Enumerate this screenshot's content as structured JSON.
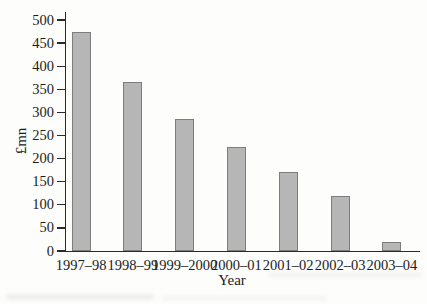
{
  "chart_data": {
    "type": "bar",
    "title": "",
    "categories": [
      "1997–98",
      "1998–99",
      "1999–2000",
      "2000–01",
      "2001–02",
      "2002–03",
      "2003–04"
    ],
    "values": [
      475,
      365,
      285,
      225,
      170,
      120,
      20
    ],
    "xlabel": "Year",
    "ylabel": "£mn",
    "ylim": [
      0,
      500
    ],
    "yticks": [
      0,
      50,
      100,
      150,
      200,
      250,
      300,
      350,
      400,
      450,
      500
    ],
    "grid": false,
    "legend": null,
    "bar_fill": "#b6b6b6",
    "bar_border": "#7d7d7d",
    "axis_color": "#2a2a2a"
  }
}
